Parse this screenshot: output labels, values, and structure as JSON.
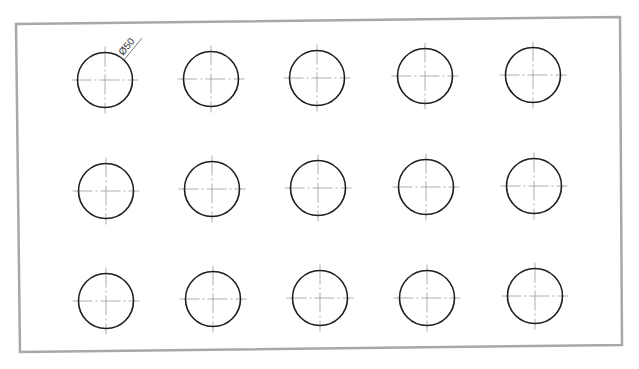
{
  "drawing": {
    "type": "hole-pattern",
    "rows": 3,
    "cols": 5,
    "hole_diameter_label": "Ø50",
    "colors": {
      "frame": "#a8a8a8",
      "hole_outline": "#1e1e1e",
      "centerline": "#9a9a9a",
      "dimension_text": "#333333"
    },
    "frame_corners": [
      [
        16,
        24
      ],
      [
        620,
        17
      ],
      [
        622,
        345
      ],
      [
        20,
        352
      ]
    ],
    "hole_radius_px": 27.5,
    "holes": [
      {
        "row": 1,
        "col": 1,
        "cx": 105,
        "cy": 80
      },
      {
        "row": 1,
        "col": 2,
        "cx": 211,
        "cy": 79
      },
      {
        "row": 1,
        "col": 3,
        "cx": 317,
        "cy": 78
      },
      {
        "row": 1,
        "col": 4,
        "cx": 425,
        "cy": 76
      },
      {
        "row": 1,
        "col": 5,
        "cx": 533,
        "cy": 75
      },
      {
        "row": 2,
        "col": 1,
        "cx": 106,
        "cy": 191
      },
      {
        "row": 2,
        "col": 2,
        "cx": 212,
        "cy": 189
      },
      {
        "row": 2,
        "col": 3,
        "cx": 318,
        "cy": 188
      },
      {
        "row": 2,
        "col": 4,
        "cx": 426,
        "cy": 187
      },
      {
        "row": 2,
        "col": 5,
        "cx": 534,
        "cy": 186
      },
      {
        "row": 3,
        "col": 1,
        "cx": 106,
        "cy": 301
      },
      {
        "row": 3,
        "col": 2,
        "cx": 213,
        "cy": 299
      },
      {
        "row": 3,
        "col": 3,
        "cx": 320,
        "cy": 298
      },
      {
        "row": 3,
        "col": 4,
        "cx": 427,
        "cy": 298
      },
      {
        "row": 3,
        "col": 5,
        "cx": 535,
        "cy": 296
      }
    ],
    "dimension": {
      "label": "Ø50",
      "attached_to_hole": {
        "row": 1,
        "col": 1
      },
      "leader_start": [
        124,
        60
      ],
      "leader_end": [
        142,
        38
      ],
      "text_angle_deg": -50
    }
  }
}
